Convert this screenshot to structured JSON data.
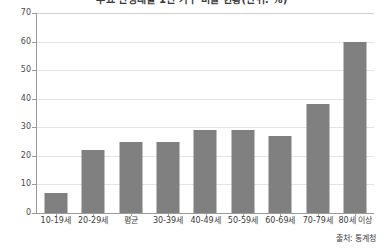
{
  "chart_data": {
    "type": "bar",
    "title": "주요 연령대별 1인 가구 비율 현황(단위: %)",
    "xlabel": "",
    "ylabel": "",
    "categories": [
      "10-19세",
      "20-29세",
      "평균",
      "30-39세",
      "40-49세",
      "50-59세",
      "60-69세",
      "70-79세",
      "80세 이상"
    ],
    "values": [
      7,
      22,
      25,
      25,
      29,
      29,
      27,
      38,
      60
    ],
    "ylim": [
      0,
      70
    ],
    "yticks": [
      0,
      10,
      20,
      30,
      40,
      50,
      60,
      70
    ],
    "ytick_labels": [
      "0",
      "10",
      "20",
      "30",
      "40",
      "50",
      "60",
      "70"
    ],
    "grid": true,
    "legend": false,
    "legend_position": "none",
    "bar_color": "#808080",
    "gridline_color": "#e4e4e4",
    "axis_color": "#9a9a9a"
  },
  "source": {
    "note": "출처: 통계청"
  }
}
